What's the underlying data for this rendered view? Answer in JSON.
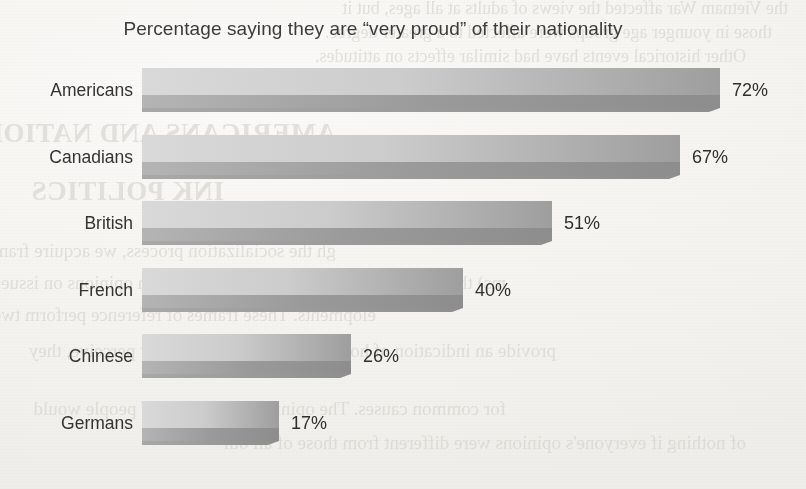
{
  "page": {
    "background_color": "#f6f5f3",
    "bleed_through_lines": [
      "the Vietnam War affected the views of adults at all ages, but it",
      "those in younger age groups were affected to a greater degree.",
      "Other historical events have had similar effects on attitudes.",
      "AMERICANS AND NATIONAL IDENTITY",
      "INK POLITICS",
      "gh the socialization process, we acquire frames of referen",
      "ms) that serve as reference points when we form opinions on issues",
      "elopments. These frames of reference perform two func-",
      "provide an indication of how people in our community perceive, they",
      "for common causes. The opinions of millions of people would",
      "of nothing if everyone's opinions were different from those of all oth"
    ]
  },
  "chart_data": {
    "type": "bar",
    "orientation": "horizontal",
    "title": "Percentage saying they are “very proud” of their nationality",
    "xlabel": "",
    "ylabel": "",
    "categories": [
      "Americans",
      "Canadians",
      "British",
      "French",
      "Chinese",
      "Germans"
    ],
    "values": [
      72,
      67,
      51,
      40,
      26,
      17
    ],
    "value_labels": [
      "72%",
      "67%",
      "51%",
      "40%",
      "26%",
      "17%"
    ],
    "xlim": [
      0,
      72
    ],
    "grid": false,
    "legend": null,
    "bar_style": {
      "face_top": "#d9d9d9",
      "face_mid": "#bdbdbd",
      "face_right": "#9e9e9e",
      "shadow_band": "#9a9a9a",
      "bevel": "#8e8e8e"
    }
  }
}
